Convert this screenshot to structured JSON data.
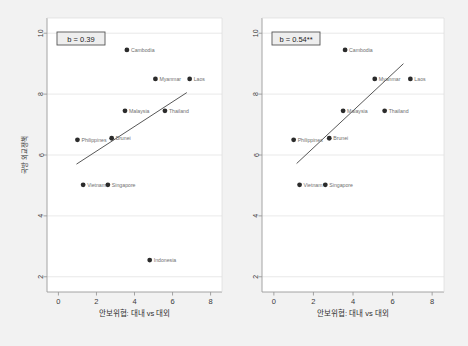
{
  "figure": {
    "background_color": "#f2f2f2",
    "plot_background_color": "#ffffff",
    "frame_color": "#9a9a9a",
    "point_color": "#2b2b2b",
    "line_color": "#444444",
    "grid_color": "#e3e3e3",
    "axis_text_color": "#3a3a3a",
    "label_text_color": "#6f6f6f",
    "caption": ""
  },
  "chart_data": [
    {
      "type": "scatter",
      "panel_id": "left",
      "title": "",
      "xlabel": "안보위협: 대내 vs 대외",
      "ylabel": "국방 외교정책",
      "xlim": [
        -0.6,
        8.6
      ],
      "ylim": [
        1.5,
        10.5
      ],
      "xticks": [
        0,
        2,
        4,
        6,
        8
      ],
      "yticks": [
        2,
        4,
        6,
        8,
        10
      ],
      "grid": true,
      "annotation": "b = 0.39",
      "points": [
        {
          "label": "Cambodia",
          "x": 3.6,
          "y": 9.45,
          "label_side": "right"
        },
        {
          "label": "Myanmar",
          "x": 5.1,
          "y": 8.5,
          "label_side": "right"
        },
        {
          "label": "Laos",
          "x": 6.9,
          "y": 8.5,
          "label_side": "right"
        },
        {
          "label": "Malaysia",
          "x": 3.5,
          "y": 7.45,
          "label_side": "right"
        },
        {
          "label": "Thailand",
          "x": 5.6,
          "y": 7.45,
          "label_side": "right"
        },
        {
          "label": "Philippines",
          "x": 1.0,
          "y": 6.5,
          "label_side": "right"
        },
        {
          "label": "Brunei",
          "x": 2.8,
          "y": 6.55,
          "label_side": "right"
        },
        {
          "label": "Vietnam",
          "x": 1.3,
          "y": 5.02,
          "label_side": "right"
        },
        {
          "label": "Singapore",
          "x": 2.6,
          "y": 5.02,
          "label_side": "right"
        },
        {
          "label": "Indonesia",
          "x": 4.8,
          "y": 2.55,
          "label_side": "right"
        }
      ],
      "fit_line": {
        "x0": 0.95,
        "y0": 5.7,
        "x1": 6.75,
        "y1": 8.05
      }
    },
    {
      "type": "scatter",
      "panel_id": "right",
      "title": "",
      "xlabel": "안보위협: 대내 vs 대외",
      "ylabel": "",
      "xlim": [
        -0.6,
        8.6
      ],
      "ylim": [
        1.5,
        10.5
      ],
      "xticks": [
        0,
        2,
        4,
        6,
        8
      ],
      "yticks": [
        2,
        4,
        6,
        8,
        10
      ],
      "grid": true,
      "annotation": "b = 0.54**",
      "points": [
        {
          "label": "Cambodia",
          "x": 3.6,
          "y": 9.45,
          "label_side": "right"
        },
        {
          "label": "Myanmar",
          "x": 5.1,
          "y": 8.5,
          "label_side": "right"
        },
        {
          "label": "Laos",
          "x": 6.9,
          "y": 8.5,
          "label_side": "right"
        },
        {
          "label": "Malaysia",
          "x": 3.5,
          "y": 7.45,
          "label_side": "right"
        },
        {
          "label": "Thailand",
          "x": 5.6,
          "y": 7.45,
          "label_side": "right"
        },
        {
          "label": "Philippines",
          "x": 1.0,
          "y": 6.5,
          "label_side": "right"
        },
        {
          "label": "Brunei",
          "x": 2.8,
          "y": 6.55,
          "label_side": "right"
        },
        {
          "label": "Vietnam",
          "x": 1.3,
          "y": 5.02,
          "label_side": "right"
        },
        {
          "label": "Singapore",
          "x": 2.6,
          "y": 5.02,
          "label_side": "right"
        }
      ],
      "fit_line": {
        "x0": 1.15,
        "y0": 5.72,
        "x1": 6.55,
        "y1": 9.0
      }
    }
  ]
}
